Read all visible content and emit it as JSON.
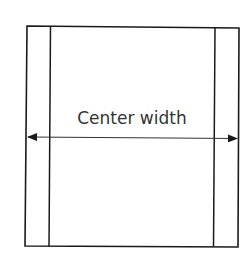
{
  "diagram": {
    "label": "Center width",
    "colors": {
      "line": "#1a1a1a",
      "text": "#333333",
      "background": "#ffffff"
    },
    "outer_box": {
      "x": 26,
      "y": 26,
      "width": 213,
      "height": 221
    },
    "inner_lines": {
      "left_x": 50,
      "right_x": 214
    },
    "arrow": {
      "y": 137,
      "x_start": 27,
      "x_end": 238,
      "direction": "double"
    }
  }
}
